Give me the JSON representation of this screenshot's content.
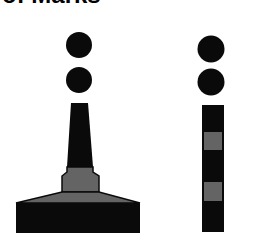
{
  "title": "of Marks",
  "colors": {
    "black": "#0a0a0a",
    "gray": "#646464",
    "background": "#ffffff"
  },
  "figures": [
    {
      "name": "isolated-danger-pillar-mark",
      "topmark": "two black spheres",
      "bands": [
        "black",
        "gray",
        "black"
      ]
    },
    {
      "name": "isolated-danger-spar-mark",
      "topmark": "two black spheres",
      "bands": [
        "black",
        "gray",
        "black",
        "gray",
        "black"
      ]
    }
  ]
}
